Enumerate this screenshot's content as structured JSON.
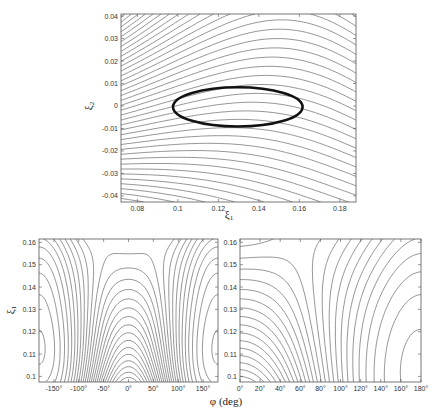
{
  "chart_data": [
    {
      "id": "top",
      "type": "contour",
      "title": "",
      "xlabel": "ξ1",
      "ylabel": "ξ2",
      "xlim": [
        0.0719,
        0.188
      ],
      "ylim": [
        -0.0427,
        0.0409
      ],
      "xticks": [
        0.08,
        0.1,
        0.12,
        0.14,
        0.16,
        0.18
      ],
      "xtick_labels": [
        "0.08",
        "0.1",
        "0.12",
        "0.14",
        "0.16",
        "0.18"
      ],
      "yticks": [
        0.04,
        0.03,
        0.02,
        0.01,
        0,
        -0.01,
        -0.02,
        -0.03,
        -0.04
      ],
      "ytick_labels": [
        "0.04",
        "0.03",
        "0.02",
        "0.01",
        "0",
        "-0.01",
        "-0.02",
        "-0.03",
        "-0.04"
      ],
      "grid": false,
      "annotation": {
        "shape": "ellipse",
        "center": [
          0.1296,
          -0.0004
        ],
        "semi_axes": [
          0.032,
          0.0087
        ]
      },
      "box_px": {
        "x": 121,
        "y": 14,
        "w": 235,
        "h": 188
      }
    },
    {
      "id": "bottom-left",
      "type": "contour",
      "title": "",
      "xlabel": "φ (deg)",
      "ylabel": "ξ1",
      "xlim": [
        -180,
        180
      ],
      "ylim": [
        0.0975,
        0.1615
      ],
      "xticks": [
        -150,
        -100,
        -50,
        0,
        50,
        100,
        150
      ],
      "xtick_labels": [
        "-150°",
        "-100°",
        "-50°",
        "0°",
        "50°",
        "100°",
        "150°"
      ],
      "yticks": [
        0.16,
        0.15,
        0.14,
        0.13,
        0.12,
        0.11,
        0.1
      ],
      "ytick_labels": [
        "0.16",
        "0.15",
        "0.14",
        "0.13",
        "0.12",
        "0.11",
        "0.1"
      ],
      "grid": false,
      "box_px": {
        "x": 39,
        "y": 239,
        "w": 179,
        "h": 143
      }
    },
    {
      "id": "bottom-right",
      "type": "contour",
      "title": "",
      "xlabel": "φ (deg)",
      "ylabel": "",
      "xlim": [
        0,
        180
      ],
      "ylim": [
        0.0975,
        0.1615
      ],
      "xticks": [
        0,
        20,
        40,
        60,
        80,
        100,
        120,
        140,
        160,
        180
      ],
      "xtick_labels": [
        "0°",
        "20°",
        "40°",
        "60°",
        "80°",
        "100°",
        "120°",
        "140°",
        "160°",
        "180°"
      ],
      "yticks": [
        0.16,
        0.15,
        0.14,
        0.13,
        0.12,
        0.11,
        0.1
      ],
      "ytick_labels": [
        "0.16",
        "0.15",
        "0.14",
        "0.13",
        "0.12",
        "0.11",
        "0.1"
      ],
      "grid": false,
      "box_px": {
        "x": 240,
        "y": 239,
        "w": 181,
        "h": 143
      }
    }
  ],
  "labels": {
    "top_xlabel": "ξ",
    "top_xlabel_sub": "1",
    "top_ylabel": "ξ",
    "top_ylabel_sub": "2",
    "bottom_ylabel": "ξ",
    "bottom_ylabel_sub": "1",
    "bottom_xlabel": "φ (deg)"
  }
}
